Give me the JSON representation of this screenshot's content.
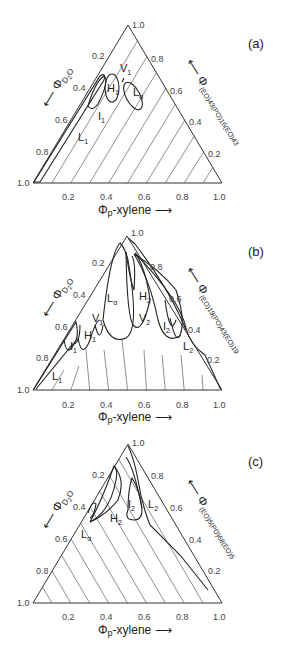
{
  "figure": {
    "panels": [
      {
        "id": "a",
        "tag": "(a)",
        "left_axis": "ΦD2O",
        "bottom_axis": "Φp-xylene",
        "right_axis": "Φ(EO)43(PO)16(EO)43",
        "right_axis_main": "Φ",
        "right_axis_sub": "(EO)43(PO)16(EO)43",
        "ticks_left": [
          "0.2",
          "0.4",
          "0.6",
          "0.8",
          "1.0"
        ],
        "ticks_bottom": [
          "0.2",
          "0.4",
          "0.6",
          "0.8",
          "1.0"
        ],
        "ticks_right": [
          "1.0",
          "0.8",
          "0.6",
          "0.4",
          "0.2"
        ],
        "phases": [
          "L1",
          "I1",
          "H1",
          "V1",
          "Lα"
        ]
      },
      {
        "id": "b",
        "tag": "(b)",
        "left_axis": "ΦD2O",
        "bottom_axis": "Φp-xylene",
        "right_axis": "Φ(EO)19(PO)43(EO)19",
        "right_axis_main": "Φ",
        "right_axis_sub": "(EO)19(PO)43(EO)19",
        "ticks_left": [
          "0.2",
          "0.4",
          "0.6",
          "0.8",
          "1.0"
        ],
        "ticks_bottom": [
          "0.2",
          "0.4",
          "0.6",
          "0.8",
          "1.0"
        ],
        "ticks_right": [
          "1.0",
          "0.8",
          "0.6",
          "0.4",
          "0.2"
        ],
        "phases": [
          "L1",
          "I1",
          "H1",
          "V1",
          "Lα",
          "V2",
          "H2",
          "I2",
          "L2"
        ]
      },
      {
        "id": "c",
        "tag": "(c)",
        "left_axis": "ΦD2O",
        "bottom_axis": "Φp-xylene",
        "right_axis": "Φ(EO)5(PO)68(EO)5",
        "right_axis_main": "Φ",
        "right_axis_sub": "(EO)5(PO)68(EO)5",
        "ticks_left": [
          "0.2",
          "0.4",
          "0.6",
          "0.8",
          "1.0"
        ],
        "ticks_bottom": [
          "0.2",
          "0.4",
          "0.6",
          "0.8",
          "1.0"
        ],
        "ticks_right": [
          "1.0",
          "0.8",
          "0.6",
          "0.4",
          "0.2"
        ],
        "phases": [
          "Lα",
          "H2",
          "I2",
          "L2"
        ]
      }
    ]
  }
}
